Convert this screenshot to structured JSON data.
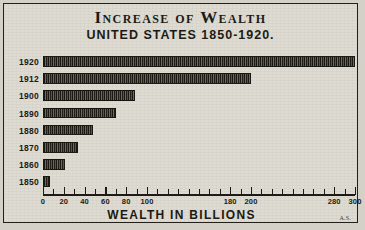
{
  "title": {
    "main": "Increase of Wealth",
    "sub": "UNITED STATES 1850-1920."
  },
  "axis": {
    "x_title": "WEALTH IN BILLIONS"
  },
  "signature": "A.S.",
  "colors": {
    "paper": "#dedbd2",
    "ink": "#1a1813",
    "bar": "#2a2620",
    "frame": "#222018"
  },
  "chart_data": {
    "type": "bar",
    "orientation": "horizontal",
    "title": "Increase of Wealth",
    "subtitle": "UNITED STATES 1850-1920.",
    "xlabel": "WEALTH IN BILLIONS",
    "ylabel": "",
    "categories": [
      "1920",
      "1912",
      "1900",
      "1890",
      "1880",
      "1870",
      "1860",
      "1850"
    ],
    "values": [
      300,
      200,
      88,
      70,
      48,
      34,
      21,
      7
    ],
    "xlim": [
      0,
      300
    ],
    "xticks": [
      0,
      10,
      20,
      30,
      40,
      50,
      60,
      70,
      80,
      90,
      100,
      110,
      120,
      130,
      140,
      150,
      160,
      170,
      180,
      190,
      200,
      210,
      220,
      230,
      240,
      250,
      260,
      270,
      280,
      290,
      300
    ],
    "xtick_labels": [
      {
        "value": 0,
        "label": "0"
      },
      {
        "value": 20,
        "label": "20"
      },
      {
        "value": 40,
        "label": "40"
      },
      {
        "value": 60,
        "label": "60"
      },
      {
        "value": 80,
        "label": "80"
      },
      {
        "value": 100,
        "label": "100"
      },
      {
        "value": 180,
        "label": "180"
      },
      {
        "value": 200,
        "label": "200"
      },
      {
        "value": 280,
        "label": "280"
      },
      {
        "value": 300,
        "label": "300"
      }
    ],
    "grid": false,
    "legend": null
  }
}
